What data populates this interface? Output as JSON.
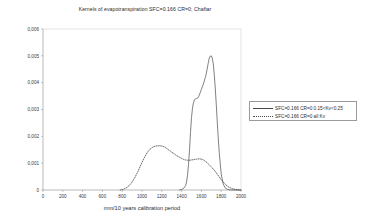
{
  "chart_data": {
    "type": "line",
    "title": "Kernels of evapotranspiration SFC=0.166 CR=0; Chaftar",
    "xlabel": "mm/10 years calibration period",
    "ylabel": "",
    "xlim": [
      0,
      2000
    ],
    "ylim": [
      0,
      0.006
    ],
    "grid": false,
    "legend_position": "right",
    "xticks": [
      "0",
      "200",
      "400",
      "600",
      "800",
      "1000",
      "1200",
      "1400",
      "1600",
      "1800",
      "2000"
    ],
    "xtick_values": [
      0,
      200,
      400,
      600,
      800,
      1000,
      1200,
      1400,
      1600,
      1800,
      2000
    ],
    "yticks": [
      "0",
      "0,001",
      "0,002",
      "0,003",
      "0,004",
      "0,005",
      "0,006"
    ],
    "ytick_values": [
      0,
      0.001,
      0.002,
      0.003,
      0.004,
      0.005,
      0.006
    ],
    "series": [
      {
        "name": "SFC=0.166 CR=0 0.15<Kv<0.25",
        "style": "solid",
        "color": "#4a4a4a",
        "x": [
          1380,
          1400,
          1420,
          1440,
          1450,
          1460,
          1470,
          1480,
          1490,
          1500,
          1510,
          1520,
          1530,
          1540,
          1550,
          1560,
          1570,
          1580,
          1600,
          1620,
          1640,
          1650,
          1660,
          1670,
          1680,
          1690,
          1700,
          1710,
          1720,
          1730,
          1740,
          1750,
          1760,
          1770,
          1780,
          1800,
          1820,
          1840,
          1860,
          1880,
          1900,
          1950,
          2000
        ],
        "y": [
          0.0,
          2e-05,
          6e-05,
          0.00016,
          0.0003,
          0.00055,
          0.00095,
          0.0015,
          0.00215,
          0.0027,
          0.00305,
          0.00325,
          0.00336,
          0.0034,
          0.00341,
          0.00342,
          0.00347,
          0.00355,
          0.00375,
          0.00395,
          0.0042,
          0.00435,
          0.00455,
          0.00475,
          0.00492,
          0.00499,
          0.005,
          0.00492,
          0.0047,
          0.0043,
          0.0038,
          0.0032,
          0.00255,
          0.00195,
          0.0014,
          0.0006,
          0.00022,
          8e-05,
          3e-05,
          1e-05,
          0.0,
          0.0,
          0.0
        ]
      },
      {
        "name": "SFC=0.166 CR=0 all Kv",
        "style": "dotted",
        "color": "#4a4a4a",
        "x": [
          780,
          820,
          850,
          880,
          900,
          930,
          960,
          990,
          1020,
          1050,
          1080,
          1110,
          1140,
          1170,
          1200,
          1230,
          1260,
          1290,
          1320,
          1350,
          1380,
          1400,
          1420,
          1440,
          1460,
          1480,
          1500,
          1520,
          1550,
          1580,
          1600,
          1620,
          1640,
          1660,
          1680,
          1700,
          1720,
          1740,
          1760,
          1780,
          1800,
          1820,
          1850,
          1880,
          1920,
          1960,
          2000
        ],
        "y": [
          0.0,
          4e-05,
          0.0001,
          0.0002,
          0.0003,
          0.00048,
          0.0007,
          0.00095,
          0.00118,
          0.00138,
          0.00152,
          0.0016,
          0.00164,
          0.00165,
          0.00164,
          0.0016,
          0.00152,
          0.00144,
          0.00136,
          0.00128,
          0.00122,
          0.00118,
          0.00114,
          0.00112,
          0.00111,
          0.00111,
          0.00112,
          0.00113,
          0.00115,
          0.00116,
          0.00115,
          0.00112,
          0.00107,
          0.00101,
          0.00094,
          0.00086,
          0.00078,
          0.00069,
          0.00059,
          0.00049,
          0.00039,
          0.0003,
          0.00018,
          0.0001,
          4e-05,
          1e-05,
          0.0
        ]
      }
    ]
  }
}
